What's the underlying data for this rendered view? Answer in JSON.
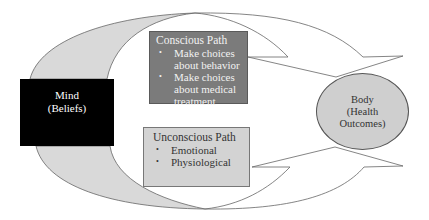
{
  "mind": {
    "title": "Mind",
    "subtitle": "(Beliefs)"
  },
  "conscious_path": {
    "title": "Conscious Path",
    "items": [
      "Make choices about behavior",
      "Make choices about medical treatment"
    ],
    "bullet": "•"
  },
  "unconscious_path": {
    "title": "Unconscious Path",
    "items": [
      "Emotional",
      "Physiological"
    ],
    "bullet": "•"
  },
  "body": {
    "line1": "Body",
    "line2": "(Health",
    "line3": "Outcomes)"
  },
  "colors": {
    "mind_fill": "#000000",
    "conscious_fill": "#7b7b7b",
    "unconscious_fill": "#d3d3d3",
    "body_fill": "#cfcfcf",
    "arrow_band": "#d9d9d9"
  }
}
